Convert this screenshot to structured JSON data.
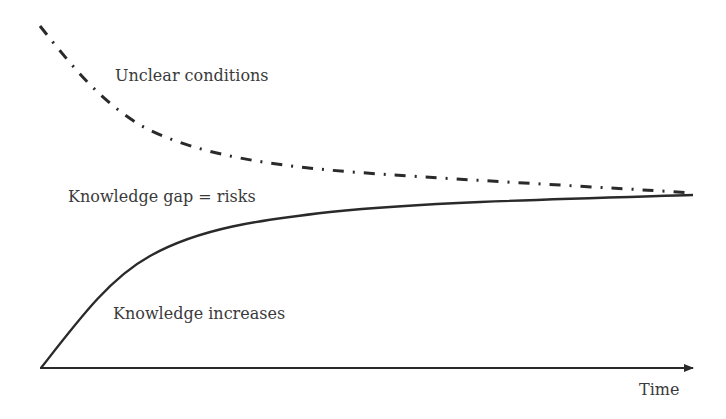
{
  "diagram": {
    "labels": {
      "unclear": "Unclear conditions",
      "gap": "Knowledge gap = risks",
      "knowledge": "Knowledge increases",
      "time": "Time"
    },
    "colors": {
      "line": "#2a2a2a",
      "text": "#3a3a3a",
      "background": "#ffffff"
    },
    "axis": {
      "x_label": "Time",
      "arrow": true
    },
    "curves": [
      {
        "name": "Unclear conditions",
        "style": "dash-dot",
        "trend": "decreasing"
      },
      {
        "name": "Knowledge increases",
        "style": "solid",
        "trend": "increasing"
      }
    ]
  }
}
